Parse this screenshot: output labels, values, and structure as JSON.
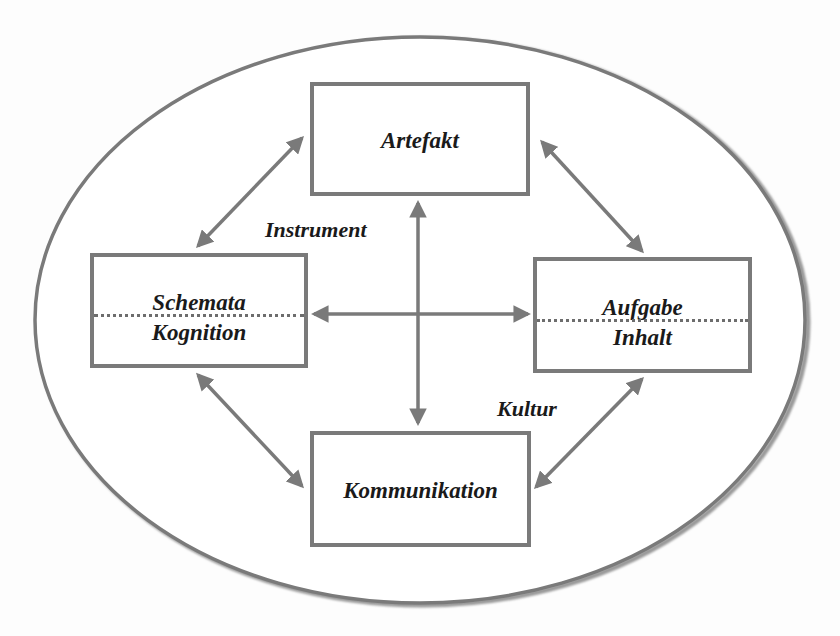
{
  "diagram": {
    "colors": {
      "stroke": "#7a7a7a",
      "text": "#1a1a1a",
      "background": "#ffffff"
    },
    "boundary": {
      "shape": "ellipse",
      "cx": 420,
      "cy": 320,
      "rx": 385,
      "ry": 283
    },
    "nodes": {
      "artefakt": {
        "label": "Artefakt"
      },
      "schemata_kognition": {
        "label_top": "Schemata",
        "label_bottom": "Kognition"
      },
      "aufgabe_inhalt": {
        "label_top": "Aufgabe",
        "label_bottom": "Inhalt"
      },
      "kommunikation": {
        "label": "Kommunikation"
      }
    },
    "edge_labels": {
      "instrument": "Instrument",
      "kultur": "Kultur"
    },
    "edges": [
      {
        "from": "artefakt",
        "to": "kommunikation",
        "type": "bidirectional"
      },
      {
        "from": "schemata_kognition",
        "to": "aufgabe_inhalt",
        "type": "bidirectional"
      },
      {
        "from": "artefakt",
        "to": "schemata_kognition",
        "type": "bidirectional"
      },
      {
        "from": "artefakt",
        "to": "aufgabe_inhalt",
        "type": "bidirectional"
      },
      {
        "from": "schemata_kognition",
        "to": "kommunikation",
        "type": "bidirectional"
      },
      {
        "from": "aufgabe_inhalt",
        "to": "kommunikation",
        "type": "bidirectional"
      }
    ]
  }
}
